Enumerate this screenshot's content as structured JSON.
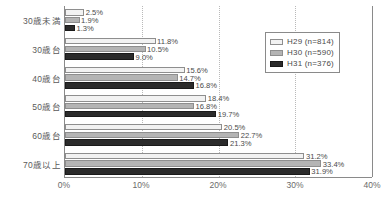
{
  "chart_data": {
    "type": "bar",
    "orientation": "horizontal",
    "title": "",
    "subtitle": "",
    "xlabel": "",
    "ylabel": "",
    "xlim": [
      0,
      40
    ],
    "xticks": [
      "0%",
      "10%",
      "20%",
      "30%",
      "40%"
    ],
    "xtick_values": [
      0,
      10,
      20,
      30,
      40
    ],
    "grid": true,
    "grid_axis": "x",
    "legend_position": "top-right",
    "value_suffix": "%",
    "categories": [
      "30歳未満",
      "30歳台",
      "40歳台",
      "50歳台",
      "60歳台",
      "70歳以上"
    ],
    "series": [
      {
        "name": "H29 (n=814)",
        "label": "H29",
        "n": "n=814",
        "color": "#f2f2f2",
        "values": [
          2.5,
          11.8,
          15.6,
          18.4,
          20.5,
          31.2
        ],
        "value_labels": [
          "2.5%",
          "11.8%",
          "15.6%",
          "18.4%",
          "20.5%",
          "31.2%"
        ]
      },
      {
        "name": "H30 (n=590)",
        "label": "H30",
        "n": "n=590",
        "color": "#b4b4b4",
        "values": [
          1.9,
          10.5,
          14.7,
          16.8,
          22.7,
          33.4
        ],
        "value_labels": [
          "1.9%",
          "10.5%",
          "14.7%",
          "16.8%",
          "22.7%",
          "33.4%"
        ]
      },
      {
        "name": "H31 (n=376)",
        "label": "H31",
        "n": "n=376",
        "color": "#2b2b2b",
        "values": [
          1.3,
          9.0,
          16.8,
          19.7,
          21.3,
          31.9
        ],
        "value_labels": [
          "1.3%",
          "9.0%",
          "16.8%",
          "19.7%",
          "21.3%",
          "31.9%"
        ]
      }
    ]
  },
  "legend": {
    "entries": [
      {
        "label": "H29",
        "count": "(n=814)",
        "full": "H29  (n=814)"
      },
      {
        "label": "H30",
        "count": "(n=590)",
        "full": "H30  (n=590)"
      },
      {
        "label": "H31",
        "count": "(n=376)",
        "full": "H31  (n=376)"
      }
    ]
  }
}
